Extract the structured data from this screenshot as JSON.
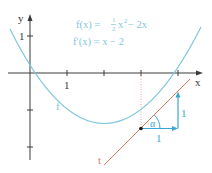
{
  "diagram": {
    "colors": {
      "axis": "#3a3a3a",
      "curve": "#7fc6de",
      "tangent": "#e0785a",
      "slope_triangle": "#3aa6d8",
      "guide": "#e8a09a",
      "formula": "#7fc6de",
      "point": "#1a1a1a"
    },
    "axes": {
      "x_label": "x",
      "y_label": "y",
      "x_tick_label": "1",
      "y_tick_label": "1",
      "origin_px": [
        30,
        73
      ],
      "unit_px": 37
    },
    "formulas": {
      "f_prefix": "f(x) = ",
      "f_frac_num": "1",
      "f_frac_den": "2",
      "f_suffix_x": "x",
      "f_exp": "2",
      "f_tail": " − 2x",
      "f_prime": "f′(x) = x − 2"
    },
    "curve": {
      "label": "f",
      "equation": "f(x) = 1/2 x^2 - 2x"
    },
    "tangent": {
      "label": "t",
      "point": [
        3,
        -1.5
      ],
      "slope": 1
    },
    "slope_triangle": {
      "run_label": "1",
      "rise_label": "1",
      "angle_label": "α"
    }
  }
}
